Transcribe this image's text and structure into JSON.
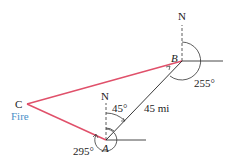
{
  "diagram": {
    "points": {
      "A": {
        "label": "A",
        "x": 106,
        "y": 140
      },
      "B": {
        "label": "B",
        "x": 182,
        "y": 61
      },
      "C": {
        "label": "C",
        "x": 27,
        "y": 104,
        "sublabel": "Fire"
      }
    },
    "north_labels": {
      "at_A": "N",
      "at_B": "N"
    },
    "angles": {
      "at_A_bearing_to_B": "45°",
      "at_A_bearing_to_C": "295°",
      "at_B_bearing_to_C": "255°"
    },
    "distance_AB": "45 mi",
    "colors": {
      "triangle_sides": "#e0506a",
      "AB_line": "#222222",
      "fire_label": "#4a90c8"
    }
  }
}
